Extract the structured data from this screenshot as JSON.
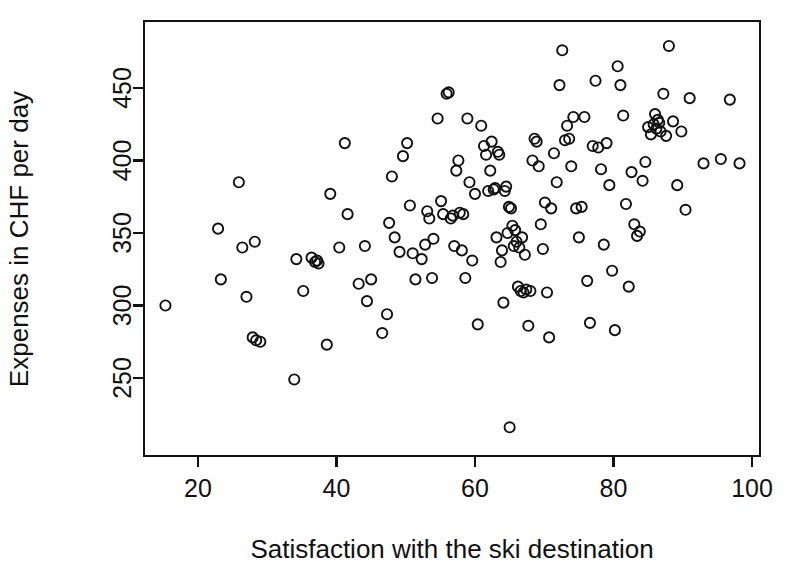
{
  "chart_data": {
    "type": "scatter",
    "title": "",
    "xlabel": "Satisfaction with the ski destination",
    "ylabel": "Expenses in CHF per day",
    "xlim": [
      12,
      101
    ],
    "ylim": [
      211,
      489
    ],
    "xticks": [
      20,
      40,
      60,
      80,
      100
    ],
    "xtick_labels": [
      "20",
      "40",
      "60",
      "80",
      "100"
    ],
    "yticks": [
      250,
      300,
      350,
      400,
      450
    ],
    "ytick_labels": [
      "250",
      "300",
      "350",
      "400",
      "450"
    ],
    "grid": false,
    "legend": null,
    "marker": "open-circle",
    "marker_color": "#111111",
    "point_count": 160,
    "x": [
      15.3,
      22.9,
      23.3,
      25.9,
      26.4,
      27.0,
      27.9,
      28.2,
      28.4,
      29.0,
      33.9,
      34.2,
      35.2,
      36.4,
      36.9,
      37.2,
      37.4,
      38.6,
      39.1,
      40.4,
      41.2,
      41.6,
      43.2,
      44.1,
      44.4,
      45.0,
      46.6,
      47.3,
      47.6,
      48.0,
      48.4,
      49.1,
      49.6,
      50.2,
      50.6,
      51.0,
      51.4,
      52.3,
      52.8,
      53.1,
      53.4,
      53.8,
      54.0,
      54.6,
      55.1,
      55.4,
      55.9,
      56.2,
      56.5,
      56.8,
      57.0,
      57.3,
      57.6,
      57.8,
      58.1,
      58.3,
      58.6,
      58.9,
      59.2,
      59.6,
      60.0,
      60.4,
      60.9,
      61.3,
      61.6,
      61.9,
      62.2,
      62.4,
      62.7,
      62.9,
      63.1,
      63.3,
      63.5,
      63.7,
      63.9,
      64.1,
      64.3,
      64.5,
      64.7,
      64.9,
      65.0,
      65.2,
      65.4,
      65.6,
      65.8,
      66.0,
      66.2,
      66.4,
      66.6,
      66.8,
      67.0,
      67.2,
      67.4,
      67.7,
      68.0,
      68.3,
      68.6,
      68.9,
      69.2,
      69.5,
      69.8,
      70.1,
      70.4,
      70.7,
      71.0,
      71.4,
      71.8,
      72.2,
      72.6,
      73.0,
      73.3,
      73.6,
      73.9,
      74.2,
      74.6,
      75.0,
      75.4,
      75.8,
      76.2,
      76.6,
      77.0,
      77.4,
      77.8,
      78.2,
      78.6,
      79.0,
      79.4,
      79.8,
      80.2,
      80.6,
      81.0,
      81.4,
      81.8,
      82.2,
      82.6,
      83.0,
      83.4,
      83.8,
      84.2,
      84.6,
      85.0,
      85.4,
      85.8,
      86.0,
      86.2,
      86.4,
      86.6,
      86.8,
      87.2,
      87.6,
      88.0,
      88.6,
      89.2,
      89.8,
      90.4,
      91.0,
      93.0,
      95.5,
      96.8,
      98.2
    ],
    "y": [
      300,
      353,
      318,
      385,
      340,
      306,
      278,
      344,
      276,
      275,
      249,
      332,
      310,
      333,
      330,
      331,
      329,
      273,
      377,
      340,
      412,
      363,
      315,
      341,
      303,
      318,
      281,
      294,
      357,
      389,
      347,
      337,
      403,
      412,
      369,
      336,
      318,
      332,
      342,
      365,
      360,
      319,
      346,
      429,
      372,
      363,
      446,
      447,
      360,
      362,
      341,
      393,
      400,
      364,
      338,
      363,
      319,
      429,
      385,
      331,
      377,
      287,
      424,
      410,
      404,
      379,
      393,
      413,
      380,
      381,
      347,
      406,
      404,
      330,
      338,
      302,
      379,
      382,
      350,
      368,
      216,
      367,
      355,
      341,
      352,
      344,
      313,
      340,
      310,
      347,
      309,
      335,
      311,
      286,
      310,
      400,
      415,
      413,
      396,
      356,
      339,
      371,
      309,
      278,
      367,
      405,
      385,
      452,
      476,
      414,
      424,
      415,
      396,
      430,
      367,
      347,
      368,
      430,
      317,
      288,
      410,
      455,
      409,
      394,
      342,
      412,
      383,
      324,
      283,
      465,
      452,
      431,
      370,
      313,
      392,
      356,
      348,
      351,
      386,
      399,
      423,
      418,
      425,
      432,
      422,
      428,
      426,
      420,
      446,
      417,
      479,
      427,
      383,
      420,
      366,
      443,
      398,
      401,
      442,
      398
    ]
  },
  "axis": {
    "y_title": "Expenses in CHF per day",
    "x_title": "Satisfaction with the ski destination"
  }
}
